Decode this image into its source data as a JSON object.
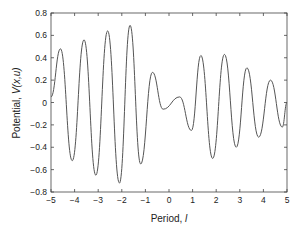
{
  "chart_data": {
    "type": "line",
    "title": "",
    "xlabel": "Period, l",
    "xlabel_main": "Period, ",
    "xlabel_var": "l",
    "ylabel": "Potential, V(x,u)",
    "ylabel_main": "Potential, ",
    "ylabel_var": "V(x,u)",
    "xlim": [
      -5,
      5
    ],
    "ylim": [
      -0.8,
      0.8
    ],
    "grid": false,
    "legend": null,
    "xticks": [
      -5,
      -4,
      -3,
      -2,
      -1,
      0,
      1,
      2,
      3,
      4,
      5
    ],
    "xtick_labels": [
      "−5",
      "−4",
      "−3",
      "−2",
      "−1",
      "0",
      "1",
      "2",
      "3",
      "4",
      "5"
    ],
    "yticks": [
      -0.8,
      -0.6,
      -0.4,
      -0.2,
      0,
      0.2,
      0.4,
      0.6,
      0.8
    ],
    "ytick_labels": [
      "−0.8",
      "−0.6",
      "−0.4",
      "−0.2",
      "0",
      "0.2",
      "0.4",
      "0.6",
      "0.8"
    ],
    "series": [
      {
        "name": "V(x,u)",
        "color": "#555555",
        "x": [
          -5.0,
          -4.6,
          -4.1,
          -3.6,
          -3.1,
          -2.6,
          -2.1,
          -1.65,
          -1.2,
          -0.7,
          -0.25,
          0.45,
          0.95,
          1.35,
          1.85,
          2.35,
          2.85,
          3.3,
          3.8,
          4.3,
          4.8,
          5.0
        ],
        "y": [
          0.05,
          0.48,
          -0.52,
          0.56,
          -0.65,
          0.64,
          -0.72,
          0.69,
          -0.55,
          0.27,
          -0.06,
          0.05,
          -0.25,
          0.42,
          -0.5,
          0.43,
          -0.4,
          0.31,
          -0.31,
          0.2,
          -0.22,
          0.0
        ]
      }
    ]
  }
}
